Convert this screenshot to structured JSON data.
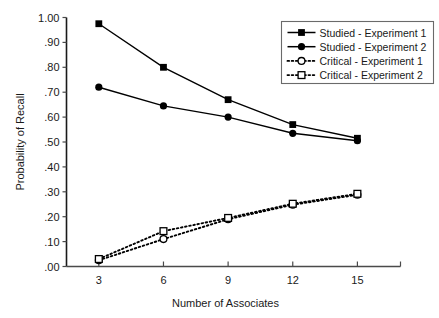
{
  "header": {
    "running_head": "",
    "page_number": ""
  },
  "chart_data": {
    "type": "line",
    "title": "",
    "xlabel": "Number of Associates",
    "ylabel": "Probability of Recall",
    "x": [
      3,
      6,
      9,
      12,
      15
    ],
    "xticklabels": [
      "3",
      "6",
      "9",
      "12",
      "15"
    ],
    "xlim": [
      1.5,
      17.0
    ],
    "ylim": [
      0.0,
      1.0
    ],
    "yticks": [
      0.0,
      0.1,
      0.2,
      0.3,
      0.4,
      0.5,
      0.6,
      0.7,
      0.8,
      0.9,
      1.0
    ],
    "yticklabels": [
      ".00",
      ".10",
      ".20",
      ".30",
      ".40",
      ".50",
      ".60",
      ".70",
      ".80",
      ".90",
      "1.00"
    ],
    "grid": false,
    "legend_position": "upper right",
    "series": [
      {
        "name": "Studied - Experiment 1",
        "values": [
          0.975,
          0.8,
          0.67,
          0.57,
          0.515
        ],
        "marker": "filled-square",
        "linestyle": "solid",
        "color": "#000000"
      },
      {
        "name": "Studied - Experiment 2",
        "values": [
          0.72,
          0.645,
          0.6,
          0.535,
          0.505
        ],
        "marker": "filled-circle",
        "linestyle": "solid",
        "color": "#000000"
      },
      {
        "name": "Critical - Experiment 1",
        "values": [
          0.025,
          0.11,
          0.19,
          0.248,
          0.288
        ],
        "marker": "open-circle",
        "linestyle": "dotted",
        "color": "#000000"
      },
      {
        "name": "Critical - Experiment 2",
        "values": [
          0.03,
          0.142,
          0.195,
          0.252,
          0.292
        ],
        "marker": "open-square",
        "linestyle": "dotted",
        "color": "#000000"
      }
    ]
  }
}
